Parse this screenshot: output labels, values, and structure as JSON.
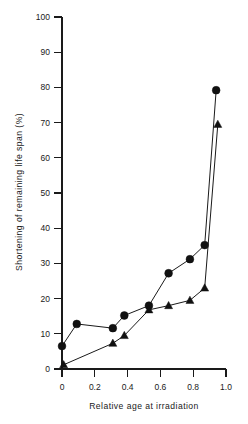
{
  "chart_data": {
    "type": "line",
    "title": "",
    "xlabel": "Relative age at irradiation",
    "ylabel": "Shortening of  remaining  life span (%)",
    "xlim": [
      0,
      1.0
    ],
    "ylim": [
      0,
      100
    ],
    "xticks": [
      0,
      0.2,
      0.4,
      0.6,
      0.8,
      1.0
    ],
    "xtick_labels": [
      "0",
      "0.2",
      "0.4",
      "0.6",
      "0.8",
      "1.0"
    ],
    "yticks": [
      0,
      10,
      20,
      30,
      40,
      50,
      60,
      70,
      80,
      90,
      100
    ],
    "ytick_labels": [
      "0",
      "10",
      "20",
      "30",
      "40",
      "50",
      "60",
      "70",
      "80",
      "90",
      "100"
    ],
    "grid": false,
    "legend": "none",
    "series": [
      {
        "name": "circle-series",
        "marker": "circle",
        "color": "#111111",
        "points": [
          {
            "x": 0.0,
            "y": 6.5
          },
          {
            "x": 0.09,
            "y": 12.8
          },
          {
            "x": 0.31,
            "y": 11.6
          },
          {
            "x": 0.38,
            "y": 15.2
          },
          {
            "x": 0.53,
            "y": 18.0
          },
          {
            "x": 0.65,
            "y": 27.2
          },
          {
            "x": 0.78,
            "y": 31.2
          },
          {
            "x": 0.87,
            "y": 35.2
          },
          {
            "x": 0.94,
            "y": 79.2
          }
        ]
      },
      {
        "name": "triangle-series",
        "marker": "triangle",
        "color": "#111111",
        "points": [
          {
            "x": 0.01,
            "y": 1.2
          },
          {
            "x": 0.31,
            "y": 7.3
          },
          {
            "x": 0.38,
            "y": 9.5
          },
          {
            "x": 0.53,
            "y": 16.8
          },
          {
            "x": 0.65,
            "y": 18.0
          },
          {
            "x": 0.78,
            "y": 19.5
          },
          {
            "x": 0.87,
            "y": 23.0
          },
          {
            "x": 0.95,
            "y": 69.5
          }
        ]
      }
    ]
  }
}
